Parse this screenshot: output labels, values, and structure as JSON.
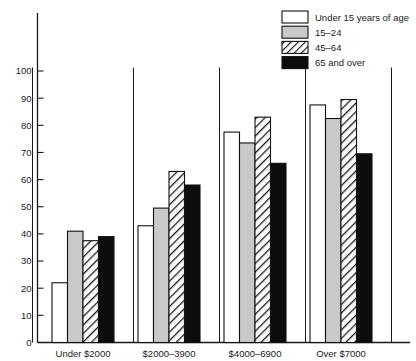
{
  "chart_data": {
    "type": "bar",
    "title": "",
    "subtitle": "",
    "xlabel": "",
    "ylabel": "",
    "categories": [
      "Under  $2000",
      "$2000–3900",
      "$4000–6900",
      "Over  $7000"
    ],
    "series": [
      {
        "name": "Under 15 years of age",
        "values": [
          22,
          43,
          77.5,
          87.5
        ],
        "swatch": "white"
      },
      {
        "name": "15–24",
        "values": [
          41,
          49.5,
          73.5,
          82.5
        ],
        "swatch": "gray"
      },
      {
        "name": "45–64",
        "values": [
          37.5,
          63,
          83,
          89.5
        ],
        "swatch": "hatch"
      },
      {
        "name": "65 and over",
        "values": [
          39,
          58,
          66,
          69.5
        ],
        "swatch": "black"
      }
    ],
    "ylim": [
      0,
      105
    ],
    "yticks": [
      0,
      10,
      20,
      30,
      40,
      50,
      60,
      70,
      80,
      90,
      100
    ],
    "ytick_labels": [
      "0",
      "10",
      "20",
      "30",
      "40",
      "50",
      "60",
      "70",
      "80",
      "90",
      "100"
    ],
    "grid": false,
    "legend_position": "top-right"
  },
  "legend": {
    "entries": [
      {
        "label": "Under 15 years of age",
        "style": "white"
      },
      {
        "label": "15–24",
        "style": "gray"
      },
      {
        "label": "45–64",
        "style": "hatch"
      },
      {
        "label": "65 and over",
        "style": "black"
      }
    ]
  },
  "colors": {
    "axis": "#1a1a1a",
    "bar_white": "#ffffff",
    "bar_gray": "#c9c9c9",
    "bar_black": "#0d0d0d",
    "bar_hatch_bg": "#ffffff",
    "bar_hatch_line": "#1a1a1a",
    "background": "#ffffff"
  }
}
